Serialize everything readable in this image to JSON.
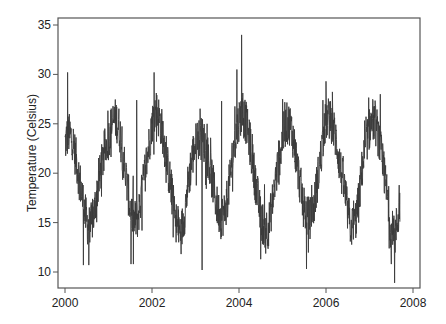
{
  "chart_data": {
    "type": "line",
    "title": "",
    "xlabel": "",
    "ylabel": "Temperature (Celsius)",
    "xlim": [
      1999.85,
      2008.15
    ],
    "ylim": [
      8.3,
      35.7
    ],
    "xticks": [
      2000,
      2002,
      2004,
      2006,
      2008
    ],
    "xtick_labels": [
      "2000",
      "2002",
      "2004",
      "2006",
      "2008"
    ],
    "yticks": [
      10,
      15,
      20,
      25,
      30,
      35
    ],
    "ytick_labels": [
      "10",
      "15",
      "20",
      "25",
      "30",
      "35"
    ],
    "grid": false,
    "legend": null,
    "line_color": "#3a3a3a",
    "frame_color": "#555555",
    "series": [
      {
        "name": "Temperature",
        "x_start": 2000.0,
        "x_end": 2007.7,
        "monthly_x": [
          2000.0,
          2000.08,
          2000.17,
          2000.25,
          2000.33,
          2000.42,
          2000.5,
          2000.58,
          2000.67,
          2000.75,
          2000.83,
          2000.92,
          2001.0,
          2001.08,
          2001.17,
          2001.25,
          2001.33,
          2001.42,
          2001.5,
          2001.58,
          2001.67,
          2001.75,
          2001.83,
          2001.92,
          2002.0,
          2002.08,
          2002.17,
          2002.25,
          2002.33,
          2002.42,
          2002.5,
          2002.58,
          2002.67,
          2002.75,
          2002.83,
          2002.92,
          2003.0,
          2003.08,
          2003.17,
          2003.25,
          2003.33,
          2003.42,
          2003.5,
          2003.58,
          2003.67,
          2003.75,
          2003.83,
          2003.92,
          2004.0,
          2004.08,
          2004.17,
          2004.25,
          2004.33,
          2004.42,
          2004.5,
          2004.58,
          2004.67,
          2004.75,
          2004.83,
          2004.92,
          2005.0,
          2005.08,
          2005.17,
          2005.25,
          2005.33,
          2005.42,
          2005.5,
          2005.58,
          2005.67,
          2005.75,
          2005.83,
          2005.92,
          2006.0,
          2006.08,
          2006.17,
          2006.25,
          2006.33,
          2006.42,
          2006.5,
          2006.58,
          2006.67,
          2006.75,
          2006.83,
          2006.92,
          2007.0,
          2007.08,
          2007.17,
          2007.25,
          2007.33,
          2007.42,
          2007.5,
          2007.58,
          2007.67,
          2007.7
        ],
        "monthly_mean": [
          23.0,
          24.0,
          23.5,
          21.5,
          19.5,
          17.0,
          15.0,
          14.5,
          16.0,
          18.5,
          20.5,
          22.5,
          23.5,
          25.0,
          25.5,
          24.5,
          22.0,
          19.0,
          16.5,
          15.0,
          15.5,
          17.5,
          20.0,
          22.5,
          25.0,
          26.5,
          25.5,
          24.0,
          21.5,
          19.0,
          16.5,
          14.5,
          14.0,
          16.0,
          19.0,
          21.5,
          23.0,
          23.5,
          23.5,
          22.5,
          20.5,
          18.5,
          16.5,
          15.5,
          16.0,
          18.0,
          21.0,
          23.5,
          25.5,
          26.0,
          25.0,
          23.0,
          20.5,
          18.0,
          15.5,
          14.5,
          14.5,
          16.5,
          19.0,
          21.5,
          23.5,
          25.0,
          25.0,
          23.5,
          21.0,
          18.5,
          16.5,
          15.5,
          15.5,
          17.5,
          20.0,
          23.0,
          25.5,
          25.5,
          24.5,
          23.0,
          20.5,
          18.5,
          16.0,
          14.5,
          15.0,
          17.0,
          20.5,
          23.0,
          24.5,
          25.5,
          24.5,
          22.5,
          20.0,
          17.5,
          14.0,
          13.5,
          16.0,
          17.0
        ],
        "noise_amplitude": 2.2,
        "spikes": [
          {
            "x": 2000.06,
            "y": 30.2
          },
          {
            "x": 2000.42,
            "y": 10.7
          },
          {
            "x": 2000.55,
            "y": 10.7
          },
          {
            "x": 2001.65,
            "y": 27.4
          },
          {
            "x": 2001.52,
            "y": 10.8
          },
          {
            "x": 2001.57,
            "y": 10.8
          },
          {
            "x": 2002.05,
            "y": 30.2
          },
          {
            "x": 2003.15,
            "y": 10.2
          },
          {
            "x": 2003.6,
            "y": 27.3
          },
          {
            "x": 2004.06,
            "y": 34.0
          },
          {
            "x": 2003.95,
            "y": 30.5
          },
          {
            "x": 2004.5,
            "y": 11.3
          },
          {
            "x": 2005.0,
            "y": 27.5
          },
          {
            "x": 2005.55,
            "y": 10.3
          },
          {
            "x": 2006.0,
            "y": 29.3
          },
          {
            "x": 2007.25,
            "y": 28.0
          },
          {
            "x": 2007.5,
            "y": 10.8
          },
          {
            "x": 2007.58,
            "y": 8.9
          },
          {
            "x": 2007.68,
            "y": 18.8
          }
        ]
      }
    ]
  },
  "plot_area": {
    "left": 58,
    "top": 18,
    "right": 420,
    "bottom": 288
  }
}
